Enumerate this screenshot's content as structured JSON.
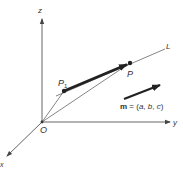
{
  "diagram": {
    "axes": {
      "z_label": "z",
      "y_label": "y",
      "x_label": "x"
    },
    "points": {
      "origin_label": "O",
      "p1_label": "P",
      "p1_subscript": "1",
      "p_label": "P"
    },
    "line_label": "L",
    "vector": {
      "name_bold": "m",
      "equals": " = (",
      "a": "a",
      "sep1": ", ",
      "b": "b",
      "sep2": ", ",
      "c": "c",
      "close": ")"
    },
    "colors": {
      "axis": "#555555",
      "thin_line": "#666666",
      "vector": "#222222",
      "text": "#333333"
    }
  }
}
